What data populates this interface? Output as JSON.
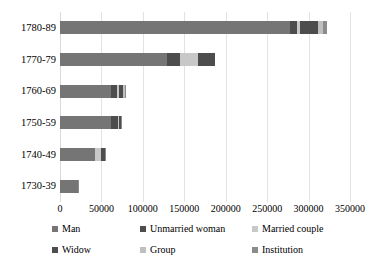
{
  "chart_data": {
    "type": "bar",
    "orientation": "horizontal",
    "stacked": true,
    "title": "",
    "xlabel": "",
    "ylabel": "",
    "xlim": [
      0,
      350000
    ],
    "grid": true,
    "legend_position": "bottom",
    "categories": [
      "1780-89",
      "1770-79",
      "1760-69",
      "1750-59",
      "1740-49",
      "1730-39"
    ],
    "tick_labels": [
      "0",
      "50000",
      "100000",
      "150000",
      "200000",
      "250000",
      "300000",
      "350000"
    ],
    "tick_values": [
      0,
      50000,
      100000,
      150000,
      200000,
      250000,
      300000,
      350000
    ],
    "series": [
      {
        "name": "Man",
        "color": "#757575",
        "values": [
          277000,
          129000,
          62000,
          62000,
          42000,
          22000
        ]
      },
      {
        "name": "Unmarried woman",
        "color": "#4d4d4d",
        "values": [
          9000,
          16000,
          7000,
          8000,
          0,
          0
        ]
      },
      {
        "name": "Married couple",
        "color": "#c8c8c8",
        "values": [
          4000,
          21000,
          2000,
          1000,
          7000,
          0
        ]
      },
      {
        "name": "Widow",
        "color": "#4d4d4d",
        "values": [
          21000,
          21000,
          5000,
          3000,
          5000,
          0
        ]
      },
      {
        "name": "Group",
        "color": "#bfbfbf",
        "values": [
          6000,
          0,
          3000,
          0,
          0,
          0
        ]
      },
      {
        "name": "Institution",
        "color": "#8c8c8c",
        "values": [
          5000,
          0,
          1000,
          1000,
          1000,
          1000
        ]
      }
    ],
    "totals": [
      322000,
      187000,
      80000,
      75000,
      55000,
      23000
    ]
  },
  "axis": {
    "gridline_color": "#e3e3e3"
  }
}
